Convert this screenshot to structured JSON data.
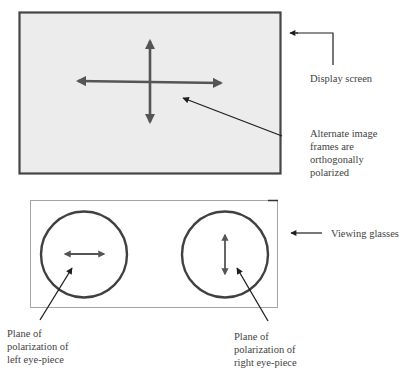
{
  "figure": {
    "type": "diagram"
  },
  "display_screen": {
    "label": "Display screen",
    "fill": "#ececec",
    "stroke": "#454545",
    "symbol": "cross-arrows (horizontal and vertical polarization)"
  },
  "alternate_frames_note": {
    "lines": [
      "Alternate image",
      "frames are",
      "orthogonally",
      "polarized"
    ]
  },
  "viewing_glasses": {
    "label": "Viewing glasses",
    "stroke": "#9a9a9a",
    "left_eyepiece": {
      "polarization": "horizontal",
      "label_lines": [
        "Plane of",
        "polarization of",
        "left eye-piece"
      ]
    },
    "right_eyepiece": {
      "polarization": "vertical",
      "label_lines": [
        "Plane of",
        "polarization of",
        "right eye-piece"
      ]
    }
  },
  "colors": {
    "arrow_gray": "#555555",
    "pointer_black": "#1e1e1e",
    "circle_stroke": "#404040"
  }
}
